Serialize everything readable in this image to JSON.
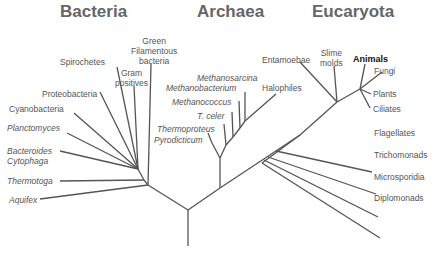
{
  "diagram": {
    "type": "phylogenetic-tree",
    "domains": [
      {
        "name": "Bacteria",
        "x": 55,
        "y": 3
      },
      {
        "name": "Archaea",
        "x": 197,
        "y": 3
      },
      {
        "name": "Eucaryota",
        "x": 312,
        "y": 3
      }
    ],
    "labels": {
      "green_filamentous": "Green\nFilamentous\nbacteria",
      "spirochetes": "Spirochetes",
      "gram_positives": "Gram\npositives",
      "proteobacteria": "Proteobacteria",
      "cyanobacteria": "Cyanobacteria",
      "planctomyces": "Planctomyces",
      "bacteroides": "Bacteroides\nCytophaga",
      "thermotoga": "Thermotoga",
      "aquifex": "Aquifex",
      "methanosarcina": "Methanosarcina",
      "methanobacterium": "Methanobacterium",
      "methanococcus": "Methanococcus",
      "t_celer": "T. celer",
      "thermoproteus": "Thermoproteus",
      "pyrodicticum": "Pyrodicticum",
      "halophiles": "Halophiles",
      "entamoebae": "Entamoebae",
      "slime_molds": "Slime\nmolds",
      "animals": "Animals",
      "fungi": "Fungi",
      "plants": "Plants",
      "ciliates": "Ciliates",
      "flagellates": "Flagellates",
      "trichomonads": "Trichomonads",
      "microsporidia": "Microsporidia",
      "diplomonads": "Diplomonads"
    },
    "colors": {
      "line": "#555555",
      "title": "#666666",
      "label": "#555555",
      "highlight": "#111111"
    }
  }
}
